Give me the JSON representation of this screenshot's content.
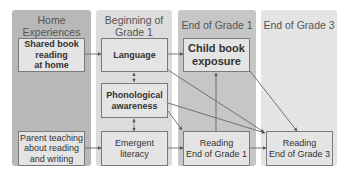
{
  "columns": [
    {
      "id": "home",
      "title": "Home Experiences",
      "title_lines": [
        "Home",
        "Experiences"
      ],
      "color": "#b8b8b8"
    },
    {
      "id": "beginning-g1",
      "title": "Beginning of Grade 1",
      "title_lines": [
        "Beginning of",
        "Grade 1"
      ],
      "color": "#dcdcdc"
    },
    {
      "id": "end-g1",
      "title": "End of Grade 1",
      "title_lines": [
        "End of Grade 1"
      ],
      "color": "#c6c6c6"
    },
    {
      "id": "end-g3",
      "title": "End of Grade 3",
      "title_lines": [
        "End of Grade 3"
      ],
      "color": "#e4e4e4"
    }
  ],
  "nodes": {
    "shared_book": {
      "lines": [
        "Shared book",
        "reading",
        "at home"
      ],
      "bold": true
    },
    "parent_teaching": {
      "lines": [
        "Parent teaching",
        "about reading",
        "and writing"
      ],
      "bold": false
    },
    "language": {
      "lines": [
        "Language"
      ],
      "bold": true
    },
    "phonological": {
      "lines": [
        "Phonological",
        "awareness"
      ],
      "bold": true
    },
    "emergent": {
      "lines": [
        "Emergent",
        "literacy"
      ],
      "bold": false
    },
    "child_book": {
      "lines": [
        "Child book",
        "exposure"
      ],
      "bold": true
    },
    "reading_g1": {
      "lines": [
        "Reading",
        "End of Grade 1"
      ],
      "bold": false
    },
    "reading_g3": {
      "lines": [
        "Reading",
        "End of Grade 3"
      ],
      "bold": false
    }
  },
  "edges": [
    {
      "from": "Shared book reading at home",
      "to": "Language"
    },
    {
      "from": "Parent teaching about reading and writing",
      "to": "Emergent literacy"
    },
    {
      "from": "Language",
      "to": "Child book exposure"
    },
    {
      "from": "Language",
      "to": "Reading End of Grade 3"
    },
    {
      "from": "Language",
      "to": "Phonological awareness",
      "bidirectional": true
    },
    {
      "from": "Phonological awareness",
      "to": "Emergent literacy",
      "bidirectional": true
    },
    {
      "from": "Phonological awareness",
      "to": "Reading End of Grade 1"
    },
    {
      "from": "Phonological awareness",
      "to": "Reading End of Grade 3"
    },
    {
      "from": "Emergent literacy",
      "to": "Reading End of Grade 1"
    },
    {
      "from": "Reading End of Grade 1",
      "to": "Child book exposure"
    },
    {
      "from": "Reading End of Grade 1",
      "to": "Reading End of Grade 3"
    },
    {
      "from": "Child book exposure",
      "to": "Reading End of Grade 3"
    }
  ]
}
